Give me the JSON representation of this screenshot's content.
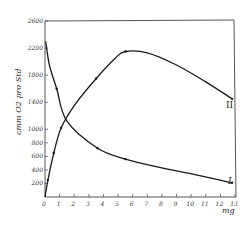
{
  "chart_data": {
    "type": "line",
    "title": "",
    "xlabel": "mg",
    "ylabel": "cmm O2 pro Std",
    "xlim": [
      0,
      13
    ],
    "ylim": [
      0,
      2600
    ],
    "grid": false,
    "legend": "none",
    "x_ticks": [
      "0",
      "1",
      "2",
      "3",
      "4",
      "5",
      "6",
      "7",
      "8",
      "9",
      "10",
      "11",
      "12",
      "13"
    ],
    "y_ticks": [
      "200",
      "400",
      "600",
      "800",
      "1000",
      "1400",
      "1800",
      "2200",
      "2600"
    ],
    "y_tick_values": [
      200,
      400,
      600,
      800,
      1000,
      1400,
      1800,
      2200,
      2600
    ],
    "series": [
      {
        "name": "I",
        "label": "I",
        "x": [
          0.05,
          0.3,
          0.8,
          1.5,
          3.6,
          5.5,
          8.0,
          10.5,
          12.8
        ],
        "y": [
          2300,
          1950,
          1600,
          1120,
          720,
          560,
          430,
          320,
          210
        ],
        "markers_at": [
          0.8,
          3.6,
          5.5,
          12.8
        ]
      },
      {
        "name": "II",
        "label": "II",
        "x": [
          0,
          0.2,
          0.6,
          1.1,
          2.0,
          3.5,
          4.8,
          5.5,
          7.0,
          9.0,
          11.0,
          12.8
        ],
        "y": [
          0,
          250,
          650,
          1020,
          1350,
          1750,
          2050,
          2150,
          2130,
          1950,
          1700,
          1450
        ],
        "markers_at": [
          0.2,
          0.6,
          1.1,
          3.5,
          5.5,
          12.8
        ]
      }
    ]
  }
}
